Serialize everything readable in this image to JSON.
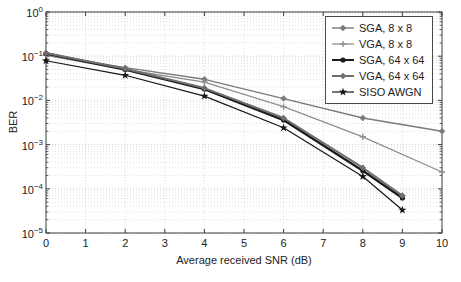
{
  "figure": {
    "kind": "BER vs SNR performance plot"
  },
  "chart_data": {
    "type": "line",
    "title": "",
    "xlabel": "Average received SNR (dB)",
    "ylabel": "BER",
    "x_scale": "linear",
    "y_scale": "log",
    "xlim": [
      0,
      10
    ],
    "ylim": [
      1e-05,
      1
    ],
    "x_ticks": [
      0,
      1,
      2,
      3,
      4,
      5,
      6,
      7,
      8,
      9,
      10
    ],
    "y_tick_exponents": [
      0,
      -1,
      -2,
      -3,
      -4,
      -5
    ],
    "grid": "on",
    "legend_position": "top-right",
    "series": [
      {
        "name": "SGA, 8 x 8",
        "color": "#7b7b7b",
        "line_width": 1.4,
        "marker": "diamond",
        "x": [
          0,
          2,
          4,
          6,
          8,
          10
        ],
        "y": [
          0.11,
          0.055,
          0.03,
          0.011,
          0.004,
          0.002
        ]
      },
      {
        "name": "VGA, 8 x 8",
        "color": "#8f8f8f",
        "line_width": 1.3,
        "marker": "plus",
        "x": [
          0,
          2,
          4,
          6,
          8,
          10
        ],
        "y": [
          0.105,
          0.05,
          0.026,
          0.0072,
          0.0015,
          0.00024
        ]
      },
      {
        "name": "SGA, 64 x 64",
        "color": "#1b1b1b",
        "line_width": 2.4,
        "marker": "circle",
        "x": [
          0,
          2,
          4,
          6,
          8,
          9
        ],
        "y": [
          0.115,
          0.05,
          0.018,
          0.0036,
          0.000255,
          6.2e-05
        ]
      },
      {
        "name": "VGA, 64 x 64",
        "color": "#6f6f6f",
        "line_width": 2.0,
        "marker": "diamond",
        "x": [
          0,
          2,
          4,
          6,
          8,
          9
        ],
        "y": [
          0.118,
          0.052,
          0.019,
          0.004,
          0.0003,
          7e-05
        ]
      },
      {
        "name": "SISO AWGN",
        "color": "#161616",
        "line_width": 1.2,
        "marker": "star",
        "x": [
          0,
          2,
          4,
          6,
          8,
          9
        ],
        "y": [
          0.079,
          0.037,
          0.0125,
          0.0024,
          0.00019,
          3.3e-05
        ]
      }
    ]
  }
}
